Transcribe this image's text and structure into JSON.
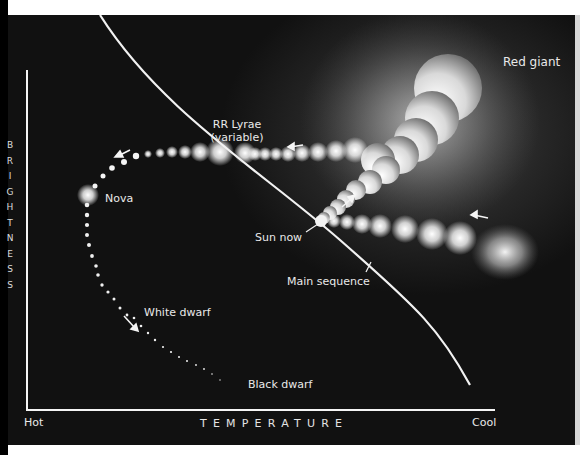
{
  "diagram": {
    "title": "",
    "type": "Hertzsprung-Russell stellar evolution diagram",
    "axes": {
      "y_label": "BRIGHTNESS",
      "y_letters": [
        "B",
        "R",
        "I",
        "G",
        "H",
        "T",
        "N",
        "E",
        "S",
        "S"
      ],
      "x_label": "TEMPERATURE",
      "x_left": "Hot",
      "x_right": "Cool"
    },
    "labels": {
      "red_giant": "Red giant",
      "rr_lyrae_line1": "RR Lyrae",
      "rr_lyrae_line2": "(variable)",
      "nova": "Nova",
      "sun_now": "Sun now",
      "main_sequence": "Main sequence",
      "white_dwarf": "White dwarf",
      "black_dwarf": "Black dwarf"
    },
    "colors": {
      "background": "#0c0c0c",
      "line": "#f2f2f2",
      "text": "#e9e9e9",
      "frame": "#ffffff"
    }
  }
}
